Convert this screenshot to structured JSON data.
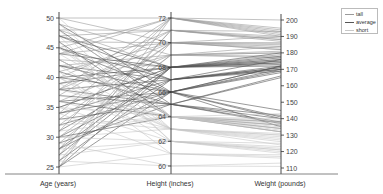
{
  "chart_data": {
    "type": "parallel_coordinates",
    "title": "",
    "axes": [
      {
        "name": "Age (years)",
        "min": 25,
        "max": 50,
        "ticks": [
          25,
          30,
          35,
          40,
          45,
          50
        ]
      },
      {
        "name": "Height (inches)",
        "min": 60,
        "max": 72,
        "ticks": [
          60,
          62,
          64,
          66,
          68,
          70,
          72
        ]
      },
      {
        "name": "Weight (pounds)",
        "min": 110,
        "max": 200,
        "ticks": [
          110,
          120,
          130,
          140,
          150,
          160,
          170,
          180,
          190,
          200
        ]
      }
    ],
    "legend": {
      "position": "top-right",
      "entries": [
        {
          "label": "tall",
          "color": "#9a9a9a"
        },
        {
          "label": "average",
          "color": "#555555"
        },
        {
          "label": "short",
          "color": "#c8c8c8"
        }
      ]
    },
    "grid": false,
    "series": [
      {
        "name": "tall",
        "color": "#9a9a9a",
        "rows": [
          [
            50,
            72,
            200
          ],
          [
            48,
            71,
            193
          ],
          [
            46,
            70,
            190
          ],
          [
            44,
            70,
            186
          ],
          [
            42,
            69,
            184
          ],
          [
            40,
            71,
            188
          ],
          [
            38,
            70,
            182
          ],
          [
            36,
            69,
            180
          ],
          [
            34,
            72,
            191
          ],
          [
            32,
            70,
            185
          ],
          [
            30,
            69,
            178
          ],
          [
            28,
            71,
            187
          ],
          [
            26,
            70,
            183
          ],
          [
            25,
            72,
            192
          ],
          [
            49,
            69,
            181
          ],
          [
            47,
            71,
            189
          ],
          [
            45,
            72,
            194
          ],
          [
            43,
            68,
            179
          ],
          [
            41,
            70,
            184
          ],
          [
            39,
            69,
            177
          ],
          [
            37,
            71,
            190
          ],
          [
            35,
            68,
            176
          ],
          [
            33,
            70,
            186
          ],
          [
            31,
            72,
            193
          ],
          [
            29,
            69,
            180
          ],
          [
            27,
            71,
            188
          ],
          [
            50,
            70,
            182
          ],
          [
            48,
            68,
            175
          ],
          [
            44,
            72,
            195
          ],
          [
            38,
            72,
            190
          ]
        ]
      },
      {
        "name": "average",
        "color": "#555555",
        "rows": [
          [
            49,
            66,
            172
          ],
          [
            47,
            67,
            170
          ],
          [
            45,
            66,
            168
          ],
          [
            44,
            68,
            174
          ],
          [
            42,
            67,
            171
          ],
          [
            41,
            65,
            165
          ],
          [
            40,
            66,
            169
          ],
          [
            39,
            68,
            173
          ],
          [
            38,
            67,
            170
          ],
          [
            37,
            65,
            166
          ],
          [
            36,
            66,
            172
          ],
          [
            35,
            68,
            175
          ],
          [
            34,
            67,
            169
          ],
          [
            33,
            65,
            138
          ],
          [
            32,
            66,
            140
          ],
          [
            31,
            68,
            176
          ],
          [
            30,
            67,
            171
          ],
          [
            29,
            65,
            142
          ],
          [
            28,
            66,
            135
          ],
          [
            27,
            68,
            174
          ],
          [
            26,
            67,
            172
          ],
          [
            25,
            66,
            170
          ],
          [
            46,
            64,
            138
          ],
          [
            43,
            64,
            132
          ],
          [
            48,
            65,
            140
          ],
          [
            45,
            67,
            176
          ],
          [
            40,
            68,
            178
          ],
          [
            36,
            64,
            136
          ],
          [
            34,
            66,
            145
          ],
          [
            30,
            64,
            134
          ],
          [
            28,
            68,
            177
          ],
          [
            25,
            68,
            172
          ],
          [
            42,
            66,
            141
          ],
          [
            38,
            65,
            137
          ],
          [
            47,
            68,
            180
          ]
        ]
      },
      {
        "name": "short",
        "color": "#c8c8c8",
        "rows": [
          [
            50,
            64,
            135
          ],
          [
            48,
            63,
            130
          ],
          [
            46,
            62,
            125
          ],
          [
            44,
            64,
            132
          ],
          [
            42,
            63,
            128
          ],
          [
            40,
            62,
            122
          ],
          [
            38,
            64,
            134
          ],
          [
            36,
            63,
            127
          ],
          [
            34,
            61,
            118
          ],
          [
            32,
            64,
            136
          ],
          [
            30,
            63,
            124
          ],
          [
            28,
            62,
            120
          ],
          [
            26,
            60,
            113
          ],
          [
            25,
            61,
            116
          ],
          [
            49,
            64,
            138
          ],
          [
            47,
            62,
            121
          ],
          [
            45,
            63,
            130
          ],
          [
            43,
            64,
            140
          ],
          [
            41,
            61,
            117
          ],
          [
            39,
            63,
            126
          ],
          [
            37,
            64,
            133
          ],
          [
            35,
            62,
            123
          ],
          [
            33,
            63,
            131
          ],
          [
            31,
            64,
            137
          ],
          [
            29,
            60,
            111
          ],
          [
            27,
            62,
            119
          ],
          [
            45,
            64,
            143
          ],
          [
            40,
            63,
            129
          ],
          [
            35,
            64,
            139
          ],
          [
            30,
            62,
            121
          ]
        ]
      }
    ]
  }
}
